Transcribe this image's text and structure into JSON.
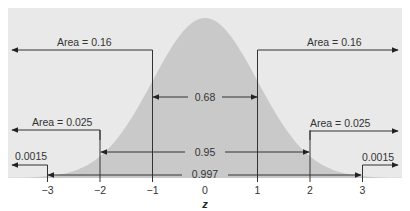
{
  "chart_data": {
    "type": "area",
    "title": "",
    "xlabel": "z",
    "ylabel": "",
    "xlim": [
      -3.3,
      3.7
    ],
    "x_ticks": [
      -3,
      -2,
      -1,
      0,
      1,
      2,
      3
    ],
    "x_tick_labels": [
      "−3",
      "−2",
      "−1",
      "0",
      "1",
      "2",
      "3"
    ],
    "grid": false,
    "legend": null,
    "series": [
      {
        "name": "Standard normal density",
        "distribution": "N(0,1)"
      }
    ],
    "colors": {
      "panel_background": "#e9e9e9",
      "curve_fill": "#c9c9c9",
      "lines": "#333333"
    },
    "annotations": {
      "tails": [
        {
          "label": "Area = 0.16",
          "from_z": -1,
          "direction": "left"
        },
        {
          "label": "Area = 0.16",
          "from_z": 1,
          "direction": "right"
        },
        {
          "label": "Area = 0.025",
          "from_z": -2,
          "direction": "left"
        },
        {
          "label": "Area = 0.025",
          "from_z": 2,
          "direction": "right"
        },
        {
          "label": "0.0015",
          "from_z": -3,
          "direction": "left"
        },
        {
          "label": "0.0015",
          "from_z": 3,
          "direction": "right"
        }
      ],
      "intervals": [
        {
          "label": "0.68",
          "from_z": -1,
          "to_z": 1
        },
        {
          "label": "0.95",
          "from_z": -2,
          "to_z": 2
        },
        {
          "label": "0.997",
          "from_z": -3,
          "to_z": 3
        }
      ]
    }
  }
}
